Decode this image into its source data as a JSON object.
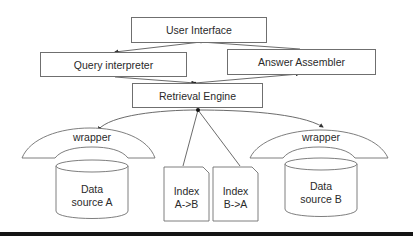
{
  "diagram": {
    "nodes": {
      "user_interface": "User Interface",
      "query_interpreter": "Query interpreter",
      "answer_assembler": "Answer Assembler",
      "retrieval_engine": "Retrieval Engine",
      "wrapper_a": "wrapper",
      "wrapper_b": "wrapper",
      "data_source_a": {
        "line1": "Data",
        "line2": "source A"
      },
      "data_source_b": {
        "line1": "Data",
        "line2": "source B"
      },
      "index_ab": {
        "line1": "Index",
        "line2": "A->B"
      },
      "index_ba": {
        "line1": "Index",
        "line2": "B->A"
      }
    },
    "edges": [
      {
        "from": "User Interface",
        "to": "Query interpreter"
      },
      {
        "from": "User Interface",
        "to": "Answer Assembler"
      },
      {
        "from": "Query interpreter",
        "to": "Retrieval Engine"
      },
      {
        "from": "Retrieval Engine",
        "to": "Answer Assembler"
      },
      {
        "from": "Retrieval Engine",
        "to": "wrapper (Data source A)"
      },
      {
        "from": "Retrieval Engine",
        "to": "wrapper (Data source B)"
      },
      {
        "from": "Retrieval Engine",
        "to": "Index A->B"
      },
      {
        "from": "Retrieval Engine",
        "to": "Index B->A"
      }
    ],
    "colors": {
      "stroke": "#6f6f6f",
      "text": "#2a2a2a",
      "rule": "#151515",
      "background": "#ffffff"
    }
  }
}
